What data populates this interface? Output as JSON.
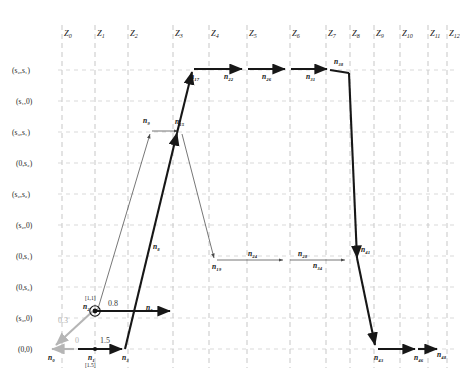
{
  "figure": {
    "type": "trellis-state-transition-diagram"
  },
  "axes": {
    "x_label_prefix": "Z",
    "columns": [
      "Z_0",
      "Z_1",
      "Z_2",
      "Z_3",
      "Z_4",
      "Z_5",
      "Z_6",
      "Z_7",
      "Z_8",
      "Z_9",
      "Z_10",
      "Z_11",
      "Z_12"
    ],
    "column_sub": [
      "0",
      "1",
      "2",
      "3",
      "4",
      "5",
      "6",
      "7",
      "8",
      "9",
      "10",
      "11",
      "12"
    ],
    "rows": [
      "(s₂,s₁)",
      "(s₁,0)",
      "(s₃,s₁)",
      "(0,s₂)",
      "(s₂,s₂)",
      "(s₂,0)",
      "(0,s₁)",
      "(0,s₃)",
      "(s₃,0)",
      "(0,0)"
    ]
  },
  "nodes": [
    {
      "id": "n_0",
      "label": "n₀"
    },
    {
      "id": "n_1",
      "label": "n₁",
      "bracket": "[1.5]"
    },
    {
      "id": "n_2",
      "label": "n₂",
      "bracket": "[1,1]"
    },
    {
      "id": "n_3",
      "label": "n₃"
    },
    {
      "id": "n_5",
      "label": "n₅"
    },
    {
      "id": "n_8",
      "label": "n₈"
    },
    {
      "id": "n_9",
      "label": "n₉"
    },
    {
      "id": "n_15",
      "label": "n₁₅"
    },
    {
      "id": "n_17",
      "label": "n₁₇"
    },
    {
      "id": "n_19",
      "label": "n₁₉"
    },
    {
      "id": "n_22",
      "label": "n₂₂"
    },
    {
      "id": "n_24",
      "label": "n₂₄"
    },
    {
      "id": "n_26",
      "label": "n₂₆"
    },
    {
      "id": "n_28",
      "label": "n₂₈"
    },
    {
      "id": "n_31",
      "label": "n₃₁"
    },
    {
      "id": "n_34",
      "label": "n₃₄"
    },
    {
      "id": "n_38",
      "label": "n₃₈"
    },
    {
      "id": "n_41",
      "label": "n₄₁"
    },
    {
      "id": "n_43",
      "label": "n₄₃"
    },
    {
      "id": "n_46",
      "label": "n₄₆"
    },
    {
      "id": "n_48",
      "label": "n₄₈"
    }
  ],
  "edge_weights": [
    {
      "id": "w_0",
      "text": "0",
      "style": "gray"
    },
    {
      "id": "w_1_5",
      "text": "1.5",
      "style": "dark"
    },
    {
      "id": "w_0_8",
      "text": "0.8",
      "style": "dark"
    },
    {
      "id": "w_0_3",
      "text": "0.3",
      "style": "gray"
    }
  ],
  "colors": {
    "background": "#ffffff",
    "grid": "#b9b9b9",
    "edge_bold": "#171717",
    "edge_thin": "#4a4a4a",
    "edge_gray": "#b5b5b5",
    "text": "#1a1a1a"
  }
}
